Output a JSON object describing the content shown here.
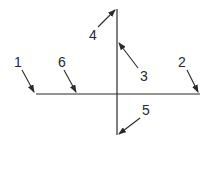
{
  "diagram": {
    "stroke_color": "#2a2a2a",
    "background": "#ffffff",
    "lines": {
      "horizontal": {
        "x1": 36,
        "y1": 94,
        "x2": 200,
        "y2": 94
      },
      "vertical": {
        "x1": 117,
        "y1": 9,
        "x2": 117,
        "y2": 135
      }
    },
    "callouts": [
      {
        "id": "1",
        "label": "1",
        "label_x": 14,
        "label_y": 55,
        "from": [
          22,
          70
        ],
        "to": [
          34,
          92
        ]
      },
      {
        "id": "6",
        "label": "6",
        "label_x": 58,
        "label_y": 55,
        "from": [
          64,
          70
        ],
        "to": [
          76,
          92
        ]
      },
      {
        "id": "4",
        "label": "4",
        "label_x": 89,
        "label_y": 28,
        "from": [
          98,
          27
        ],
        "to": [
          115,
          10
        ]
      },
      {
        "id": "3",
        "label": "3",
        "label_x": 140,
        "label_y": 69,
        "from": [
          138,
          68
        ],
        "to": [
          119,
          43
        ]
      },
      {
        "id": "2",
        "label": "2",
        "label_x": 178,
        "label_y": 55,
        "from": [
          187,
          70
        ],
        "to": [
          198,
          92
        ]
      },
      {
        "id": "5",
        "label": "5",
        "label_x": 142,
        "label_y": 103,
        "from": [
          140,
          118
        ],
        "to": [
          119,
          134
        ]
      }
    ]
  }
}
